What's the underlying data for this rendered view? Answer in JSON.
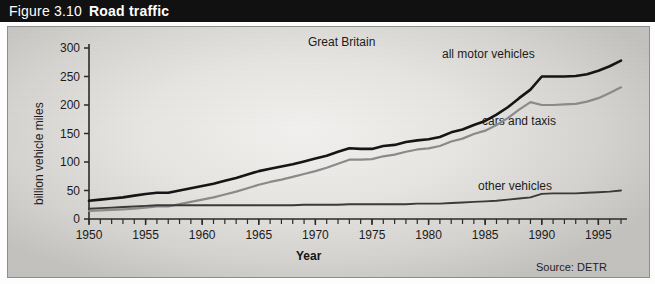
{
  "header": {
    "figure_number": "Figure 3.10",
    "figure_title": "Road traffic"
  },
  "figure": {
    "subtitle": "Great Britain",
    "source": "Source: DETR",
    "xtitle": "Year",
    "ytitle": "billion vehicle miles",
    "series_labels": {
      "all": "all motor vehicles",
      "cars": "cars and taxis",
      "other": "other vehicles"
    }
  },
  "chart_data": {
    "type": "line",
    "title": "Road traffic",
    "subtitle": "Great Britain",
    "xlabel": "Year",
    "ylabel": "billion vehicle miles",
    "xlim": [
      1950,
      1997
    ],
    "ylim": [
      0,
      300
    ],
    "yticks": [
      0,
      50,
      100,
      150,
      200,
      250,
      300
    ],
    "xticks": [
      1950,
      1955,
      1960,
      1965,
      1970,
      1975,
      1980,
      1985,
      1990,
      1995
    ],
    "xtick_labels": [
      "1950",
      "1955",
      "1960",
      "1965",
      "1970",
      "1975",
      "1980",
      "1985",
      "1990",
      "1995"
    ],
    "ytick_labels": [
      "0",
      "50",
      "100",
      "150",
      "200",
      "250",
      "300"
    ],
    "minor_xtick_interval": 1,
    "grid": false,
    "legend": "inline-annotations",
    "source": "Source: DETR",
    "x": [
      1950,
      1951,
      1952,
      1953,
      1954,
      1955,
      1956,
      1957,
      1958,
      1959,
      1960,
      1961,
      1962,
      1963,
      1964,
      1965,
      1966,
      1967,
      1968,
      1969,
      1970,
      1971,
      1972,
      1973,
      1974,
      1975,
      1976,
      1977,
      1978,
      1979,
      1980,
      1981,
      1982,
      1983,
      1984,
      1985,
      1986,
      1987,
      1988,
      1989,
      1990,
      1991,
      1992,
      1993,
      1994,
      1995,
      1996,
      1997
    ],
    "series": [
      {
        "name": "all motor vehicles",
        "color": "#151515",
        "values": [
          32,
          34,
          36,
          38,
          41,
          44,
          46,
          46,
          50,
          54,
          58,
          62,
          67,
          72,
          78,
          84,
          88,
          92,
          96,
          101,
          106,
          111,
          118,
          124,
          123,
          123,
          128,
          130,
          135,
          138,
          140,
          144,
          152,
          157,
          165,
          172,
          183,
          196,
          212,
          227,
          250,
          250,
          250,
          251,
          254,
          260,
          268,
          278
        ]
      },
      {
        "name": "cars and taxis",
        "color": "#8a8a8a",
        "values": [
          14,
          15,
          16,
          17,
          18,
          20,
          22,
          22,
          26,
          30,
          34,
          38,
          43,
          48,
          54,
          60,
          65,
          69,
          74,
          79,
          84,
          90,
          97,
          104,
          104,
          105,
          110,
          113,
          118,
          122,
          124,
          128,
          136,
          141,
          149,
          155,
          165,
          177,
          192,
          205,
          200,
          200,
          201,
          202,
          206,
          212,
          221,
          231
        ]
      },
      {
        "name": "other vehicles",
        "color": "#3a3a3a",
        "values": [
          18,
          19,
          20,
          21,
          22,
          23,
          24,
          24,
          24,
          24,
          24,
          24,
          24,
          24,
          24,
          24,
          24,
          24,
          24,
          25,
          25,
          25,
          25,
          26,
          26,
          26,
          26,
          26,
          26,
          27,
          27,
          27,
          28,
          29,
          30,
          31,
          32,
          34,
          36,
          38,
          44,
          45,
          45,
          45,
          46,
          47,
          48,
          50
        ]
      }
    ],
    "annotations": [
      {
        "text": "all motor vehicles",
        "x": 1988,
        "y": 285
      },
      {
        "text": "cars and taxis",
        "x": 1989,
        "y": 175
      },
      {
        "text": "other vehicles",
        "x": 1989,
        "y": 72
      }
    ]
  }
}
